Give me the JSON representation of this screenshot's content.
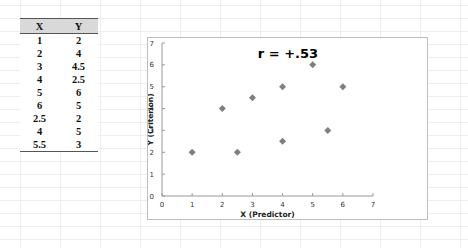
{
  "table": {
    "headers": [
      "X",
      "Y"
    ],
    "rows": [
      [
        "1",
        "2"
      ],
      [
        "2",
        "4"
      ],
      [
        "3",
        "4.5"
      ],
      [
        "4",
        "2.5"
      ],
      [
        "5",
        "6"
      ],
      [
        "6",
        "5"
      ],
      [
        "2.5",
        "2"
      ],
      [
        "4",
        "5"
      ],
      [
        "5.5",
        "3"
      ]
    ]
  },
  "chart": {
    "title": "r  =  +.53",
    "xlabel": "X  (Predictor)",
    "ylabel": "Y  (Criterion)",
    "marker_color": "#7f7f7f"
  },
  "chart_data": {
    "type": "scatter",
    "title": "r = +.53",
    "xlabel": "X (Predictor)",
    "ylabel": "Y (Criterion)",
    "xlim": [
      0,
      7
    ],
    "ylim": [
      0,
      7
    ],
    "xticks": [
      0,
      1,
      2,
      3,
      4,
      5,
      6,
      7
    ],
    "yticks": [
      0,
      1,
      2,
      3,
      4,
      5,
      6,
      7
    ],
    "grid": false,
    "legend": null,
    "series": [
      {
        "name": "Y",
        "points": [
          {
            "x": 1,
            "y": 2
          },
          {
            "x": 2,
            "y": 4
          },
          {
            "x": 3,
            "y": 4.5
          },
          {
            "x": 4,
            "y": 2.5
          },
          {
            "x": 5,
            "y": 6
          },
          {
            "x": 6,
            "y": 5
          },
          {
            "x": 2.5,
            "y": 2
          },
          {
            "x": 4,
            "y": 5
          },
          {
            "x": 5.5,
            "y": 3
          }
        ]
      }
    ]
  }
}
